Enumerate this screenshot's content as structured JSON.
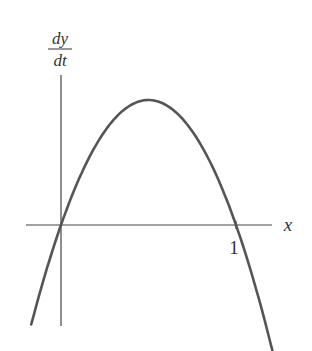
{
  "chart_data": {
    "type": "line",
    "title": "",
    "xlabel": "x",
    "ylabel_numerator": "dy",
    "ylabel_denominator": "dt",
    "ylabel": "dy/dt",
    "x_ticks": [
      {
        "value": 1,
        "label": "1"
      }
    ],
    "xlim": [
      -0.17,
      1.21
    ],
    "ylim": [
      -0.81,
      1.2
    ],
    "grid": false,
    "legend": null,
    "series": [
      {
        "name": "dy/dt",
        "description": "Downward-opening parabola with roots at x=0 and x=1, maximum at x=0.5",
        "x": [
          -0.17,
          0,
          0.1,
          0.2,
          0.3,
          0.4,
          0.5,
          0.6,
          0.7,
          0.8,
          0.9,
          1.0,
          1.18
        ],
        "values": [
          -0.79,
          0,
          0.36,
          0.64,
          0.84,
          0.96,
          1.0,
          0.96,
          0.84,
          0.64,
          0.36,
          0,
          -0.85
        ]
      }
    ],
    "colors": {
      "curve": "#555555",
      "axes": "#444444"
    }
  }
}
